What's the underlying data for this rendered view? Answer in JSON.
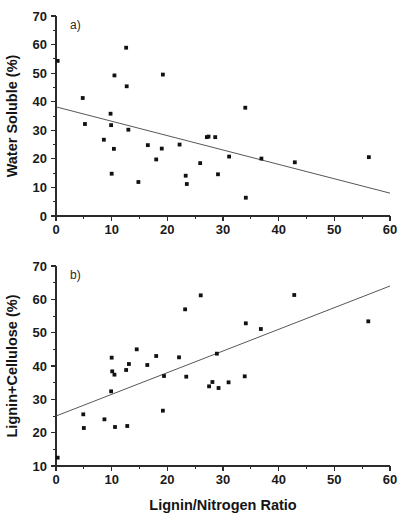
{
  "figure": {
    "xlabel": "Lignin/Nitrogen Ratio",
    "panel_a_tag": "a)",
    "panel_b_tag": "b)",
    "marker_color": "#111111",
    "line_color": "#43434a",
    "axis_color": "#2b2b2b"
  },
  "chart_data": [
    {
      "type": "scatter",
      "title": "a)",
      "xlabel": "Lignin/Nitrogen Ratio",
      "ylabel": "Water Soluble (%)",
      "xlim": [
        0,
        60
      ],
      "ylim": [
        0,
        70
      ],
      "xticks": [
        0,
        10,
        20,
        30,
        40,
        50,
        60
      ],
      "yticks": [
        0,
        10,
        20,
        30,
        40,
        50,
        60,
        70
      ],
      "xtick_labels": [
        "0",
        "10",
        "20",
        "30",
        "40",
        "50",
        "60"
      ],
      "ytick_labels": [
        "0",
        "10",
        "20",
        "30",
        "40",
        "50",
        "60",
        "70"
      ],
      "minor_ticks": true,
      "grid": false,
      "legend": "none",
      "points": [
        [
          0.3,
          54.3
        ],
        [
          4.8,
          41.3
        ],
        [
          5.2,
          32.2
        ],
        [
          8.6,
          26.7
        ],
        [
          9.8,
          35.8
        ],
        [
          9.9,
          31.8
        ],
        [
          10.0,
          14.8
        ],
        [
          10.4,
          23.5
        ],
        [
          10.5,
          49.2
        ],
        [
          12.6,
          58.9
        ],
        [
          12.7,
          45.4
        ],
        [
          13.0,
          30.2
        ],
        [
          14.8,
          11.9
        ],
        [
          16.5,
          24.8
        ],
        [
          18.0,
          19.8
        ],
        [
          19.0,
          23.6
        ],
        [
          19.2,
          49.5
        ],
        [
          22.2,
          25.0
        ],
        [
          23.3,
          14.1
        ],
        [
          23.5,
          11.2
        ],
        [
          25.9,
          18.5
        ],
        [
          27.1,
          27.6
        ],
        [
          27.4,
          27.8
        ],
        [
          28.6,
          27.6
        ],
        [
          29.1,
          14.6
        ],
        [
          31.1,
          20.8
        ],
        [
          34.0,
          37.9
        ],
        [
          34.1,
          6.4
        ],
        [
          36.9,
          20.1
        ],
        [
          42.9,
          18.8
        ],
        [
          56.2,
          20.6
        ]
      ],
      "fit_line": {
        "type": "linear-regression",
        "x": [
          0,
          60
        ],
        "y": [
          38.2,
          8.0
        ]
      }
    },
    {
      "type": "scatter",
      "title": "b)",
      "xlabel": "Lignin/Nitrogen Ratio",
      "ylabel": "Lignin+Cellulose (%)",
      "xlim": [
        0,
        60
      ],
      "ylim": [
        10,
        70
      ],
      "xticks": [
        0,
        10,
        20,
        30,
        40,
        50,
        60
      ],
      "yticks": [
        10,
        20,
        30,
        40,
        50,
        60,
        70
      ],
      "xtick_labels": [
        "0",
        "10",
        "20",
        "30",
        "40",
        "50",
        "60"
      ],
      "ytick_labels": [
        "10",
        "20",
        "30",
        "40",
        "50",
        "60",
        "70"
      ],
      "minor_ticks": true,
      "grid": false,
      "legend": "none",
      "points": [
        [
          0.3,
          12.5
        ],
        [
          4.9,
          25.5
        ],
        [
          5.0,
          21.4
        ],
        [
          8.7,
          24.0
        ],
        [
          9.9,
          32.4
        ],
        [
          10.0,
          42.5
        ],
        [
          10.1,
          38.4
        ],
        [
          10.5,
          37.4
        ],
        [
          10.6,
          21.7
        ],
        [
          12.6,
          38.8
        ],
        [
          12.8,
          22.0
        ],
        [
          13.1,
          40.6
        ],
        [
          14.5,
          45.0
        ],
        [
          16.4,
          40.3
        ],
        [
          18.0,
          43.0
        ],
        [
          19.2,
          26.6
        ],
        [
          19.4,
          37.0
        ],
        [
          22.1,
          42.6
        ],
        [
          23.2,
          57.0
        ],
        [
          23.4,
          36.8
        ],
        [
          26.0,
          61.2
        ],
        [
          27.5,
          33.9
        ],
        [
          28.1,
          35.2
        ],
        [
          28.9,
          43.7
        ],
        [
          29.2,
          33.4
        ],
        [
          31.0,
          35.1
        ],
        [
          33.9,
          36.9
        ],
        [
          34.1,
          52.8
        ],
        [
          36.8,
          51.1
        ],
        [
          42.8,
          61.3
        ],
        [
          56.1,
          53.4
        ]
      ],
      "fit_line": {
        "type": "linear-regression",
        "x": [
          0,
          60
        ],
        "y": [
          25.0,
          64.0
        ]
      }
    }
  ]
}
